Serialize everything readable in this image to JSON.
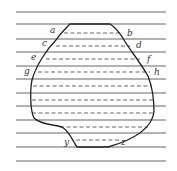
{
  "diagram": {
    "colors": {
      "lines": "#555555",
      "outline": "#222222",
      "dashed": "#555555"
    },
    "horizontal_lines_y": [
      12,
      24,
      39,
      52,
      66,
      79,
      93,
      106,
      120,
      133,
      147,
      161
    ],
    "dashed_chords": [
      {
        "y": 33,
        "x1": 64,
        "x2": 120
      },
      {
        "y": 46,
        "x1": 56,
        "x2": 130
      },
      {
        "y": 59,
        "x1": 46,
        "x2": 140
      },
      {
        "y": 72,
        "x1": 38,
        "x2": 150
      },
      {
        "y": 86,
        "x1": 33,
        "x2": 151
      },
      {
        "y": 100,
        "x1": 32,
        "x2": 153
      },
      {
        "y": 113,
        "x1": 32,
        "x2": 154
      },
      {
        "y": 127,
        "x1": 60,
        "x2": 148
      },
      {
        "y": 140,
        "x1": 76,
        "x2": 120
      }
    ],
    "labels": [
      {
        "text": "a",
        "x": 50,
        "y": 33
      },
      {
        "text": "b",
        "x": 127,
        "y": 36
      },
      {
        "text": "c",
        "x": 42,
        "y": 46
      },
      {
        "text": "d",
        "x": 136,
        "y": 48
      },
      {
        "text": "e",
        "x": 31,
        "y": 60
      },
      {
        "text": "f",
        "x": 147,
        "y": 62
      },
      {
        "text": "g",
        "x": 24,
        "y": 74
      },
      {
        "text": "h",
        "x": 154,
        "y": 75
      },
      {
        "text": "y",
        "x": 64,
        "y": 145
      },
      {
        "text": "z",
        "x": 121,
        "y": 145
      }
    ]
  }
}
